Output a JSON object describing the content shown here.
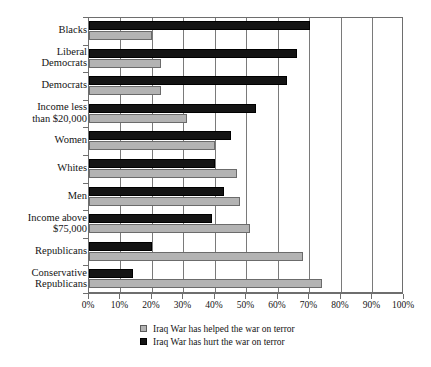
{
  "chart_data": {
    "type": "bar",
    "orientation": "horizontal",
    "title": "",
    "xlabel": "",
    "ylabel": "",
    "xlim": [
      0,
      100
    ],
    "xticks": [
      "0%",
      "10%",
      "20%",
      "30%",
      "40%",
      "50%",
      "60%",
      "70%",
      "80%",
      "90%",
      "100%"
    ],
    "xtick_values": [
      0,
      10,
      20,
      30,
      40,
      50,
      60,
      70,
      80,
      90,
      100
    ],
    "grid": true,
    "grid_axis": "x",
    "legend_position": "bottom",
    "categories": [
      "Blacks",
      "Liberal Democrats",
      "Democrats",
      "Income less than $20,000",
      "Women",
      "Whites",
      "Men",
      "Income above $75,000",
      "Republicans",
      "Conservative Republicans"
    ],
    "series": [
      {
        "name": "Iraq War has hurt the war on terror",
        "color": "#141414",
        "values": [
          70,
          66,
          63,
          53,
          45,
          40,
          43,
          39,
          20,
          14
        ]
      },
      {
        "name": "Iraq War has helped the war on terror",
        "color": "#b3b3b3",
        "values": [
          20,
          23,
          23,
          31,
          40,
          47,
          48,
          51,
          68,
          74
        ]
      }
    ]
  },
  "ylabels": [
    "Blacks",
    "Liberal\nDemocrats",
    "Democrats",
    "Income less\nthan $20,000",
    "Women",
    "Whites",
    "Men",
    "Income above\n$75,000",
    "Republicans",
    "Conservative\nRepublicans"
  ],
  "legend": {
    "items": [
      {
        "label": "Iraq War has helped the war on terror",
        "swatch": "helped"
      },
      {
        "label": "Iraq War has hurt the war on terror",
        "swatch": "hurt"
      }
    ]
  },
  "colors": {
    "helped": "#b3b3b3",
    "hurt": "#141414",
    "axis": "#6e6e6e",
    "grid": "#7a7a7a",
    "background": "#ffffff"
  }
}
